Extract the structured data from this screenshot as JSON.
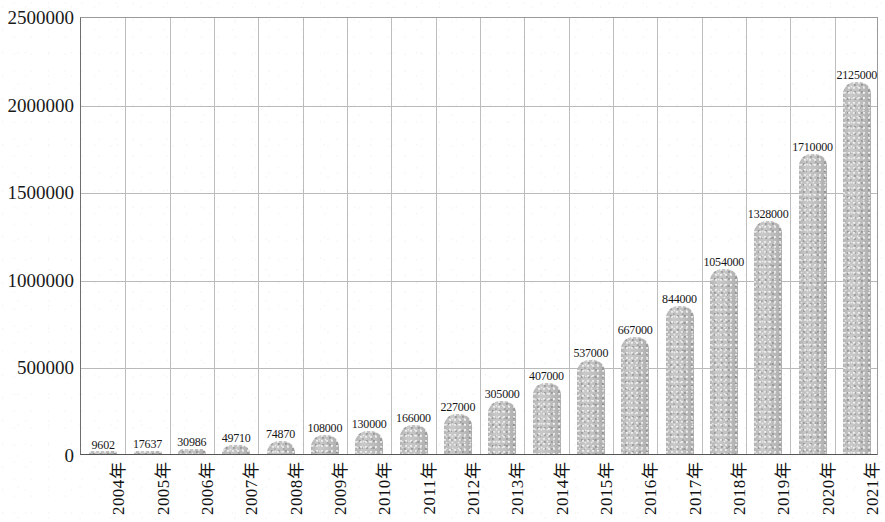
{
  "chart_data": {
    "type": "bar",
    "title": "",
    "subtitle": "",
    "xlabel": "",
    "ylabel": "",
    "grid": true,
    "legend": "none",
    "ylim": [
      0,
      2500000
    ],
    "ytick_labels": [
      "0",
      "500000",
      "1000000",
      "1500000",
      "2000000",
      "2500000"
    ],
    "ytick_values": [
      0,
      500000,
      1000000,
      1500000,
      2000000,
      2500000
    ],
    "categories": [
      "2004年",
      "2005年",
      "2006年",
      "2007年",
      "2008年",
      "2009年",
      "2010年",
      "2011年",
      "2012年",
      "2013年",
      "2014年",
      "2015年",
      "2016年",
      "2017年",
      "2018年",
      "2019年",
      "2020年",
      "2021年"
    ],
    "values": [
      9602,
      17637,
      30986,
      49710,
      74870,
      108000,
      130000,
      166000,
      227000,
      305000,
      407000,
      537000,
      667000,
      844000,
      1054000,
      1328000,
      1710000,
      2125000
    ],
    "value_labels": [
      "9602",
      "17637",
      "30986",
      "49710",
      "74870",
      "108000",
      "130000",
      "166000",
      "227000",
      "305000",
      "407000",
      "537000",
      "667000",
      "844000",
      "1054000",
      "1328000",
      "1710000",
      "2125000"
    ],
    "bar_color": "#c3c3c3",
    "gridline_color": "#bdbdbd",
    "axis_color": "#555555",
    "text_color": "#111111"
  }
}
